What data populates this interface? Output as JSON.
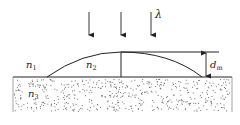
{
  "diagram": {
    "incident_light_label": "λ",
    "medium_labels": {
      "n1": {
        "base": "n",
        "sub": "1"
      },
      "n2": {
        "base": "n",
        "sub": "2"
      },
      "n3": {
        "base": "n",
        "sub": "3"
      }
    },
    "thickness_label": {
      "base": "d",
      "sub": "m"
    },
    "incident_arrow_count": 3,
    "colors": {
      "stroke": "#222222",
      "background": "#ffffff",
      "dots": "#555555"
    }
  }
}
